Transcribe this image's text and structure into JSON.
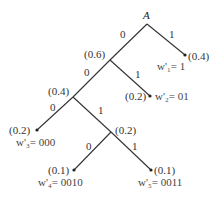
{
  "diagram": {
    "type": "huffman-tree",
    "root": {
      "label": "A"
    },
    "nodes": [
      {
        "id": "root",
        "x": 147,
        "y": 22,
        "label": "A"
      },
      {
        "id": "n06",
        "x": 110,
        "y": 60,
        "prob": "(0.6)"
      },
      {
        "id": "n04",
        "x": 73,
        "y": 97,
        "prob": "(0.4)"
      },
      {
        "id": "n02i",
        "x": 111,
        "y": 132,
        "prob": "(0.2)"
      }
    ],
    "leaves": [
      {
        "id": "w1",
        "x": 185,
        "y": 55,
        "prob": "(0.4)",
        "code_label": "w'₁= 1"
      },
      {
        "id": "w2",
        "x": 150,
        "y": 96,
        "prob": "(0.2)",
        "code_label": "w'₂= 01"
      },
      {
        "id": "w3",
        "x": 37,
        "y": 130,
        "prob": "(0.2)",
        "code_label": "w'₃= 000"
      },
      {
        "id": "w4",
        "x": 74,
        "y": 170,
        "prob": "(0.1)",
        "code_label": "w'₄= 0010"
      },
      {
        "id": "w5",
        "x": 151,
        "y": 170,
        "prob": "(0.1)",
        "code_label": "w'₅= 0011"
      }
    ],
    "edges": [
      {
        "from": "root",
        "to": "n06",
        "bit": "0"
      },
      {
        "from": "root",
        "to": "w1",
        "bit": "1"
      },
      {
        "from": "n06",
        "to": "n04",
        "bit": "0"
      },
      {
        "from": "n06",
        "to": "w2",
        "bit": "1"
      },
      {
        "from": "n04",
        "to": "w3",
        "bit": "0"
      },
      {
        "from": "n04",
        "to": "n02i",
        "bit": "1"
      },
      {
        "from": "n02i",
        "to": "w4",
        "bit": "0"
      },
      {
        "from": "n02i",
        "to": "w5",
        "bit": "1"
      }
    ]
  }
}
